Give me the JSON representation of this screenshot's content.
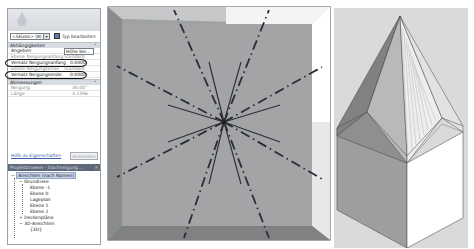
{
  "properties_panel": {
    "type_selector": {
      "value": "<Skizze> (8)",
      "arrow": "▾"
    },
    "edit_type_label": "Typ bearbeiten",
    "sections": [
      {
        "title": "Abhängigkeiten",
        "collapse": "⌃",
        "rows": [
          {
            "name": "Angeben",
            "value": "Höhe bei..."
          },
          {
            "name": "Ebene Neigungsanfang",
            "value": "Standard"
          },
          {
            "name": "Versatz Neigungsanfang",
            "value": "0.0000",
            "highlighted": true
          },
          {
            "name": "Ebene Neigungsende",
            "value": "Standard"
          },
          {
            "name": "Versatz Neigungsende",
            "value": "0.0000",
            "highlighted": true
          }
        ]
      },
      {
        "title": "Abmessungen",
        "collapse": "⌃",
        "rows": [
          {
            "name": "Neigung",
            "value": "30.00°"
          },
          {
            "name": "Länge",
            "value": "3.1596"
          }
        ]
      }
    ],
    "help_link": "Hilfe zu Eigenschaften",
    "apply_button": "Anwenden"
  },
  "project_browser": {
    "title": "Projektbrowser - Dachneigung...",
    "close": "×",
    "tree": [
      {
        "label": "Ansichten (nach Namen)",
        "level": 0,
        "toggle": "−",
        "selected": true
      },
      {
        "label": "Grundrisse",
        "level": 1,
        "toggle": "−"
      },
      {
        "label": "Ebene -1",
        "level": 2
      },
      {
        "label": "Ebene 0",
        "level": 2
      },
      {
        "label": "Lageplan",
        "level": 2
      },
      {
        "label": "Ebene 1",
        "level": 2
      },
      {
        "label": "Ebene 2",
        "level": 2
      },
      {
        "label": "Deckenpläne",
        "level": 1,
        "toggle": "+"
      },
      {
        "label": "3D-Ansichten",
        "level": 1,
        "toggle": "−"
      },
      {
        "label": "{3D}",
        "level": 2
      }
    ]
  },
  "plan_view": {
    "description": "Roof footprint sketch with slope arrows",
    "colors": {
      "roof_fill": "#9fa1a3",
      "border_dark": "#858789",
      "border_light": "#cfd1d3",
      "lines": "#2b2d30"
    }
  },
  "iso_view": {
    "description": "3D view of hexagonal spire roof",
    "colors": {
      "background": "#d9dadb",
      "dark_face": "#8d8f91",
      "mid_face": "#b9bbbd",
      "light_face": "#ffffff"
    }
  }
}
